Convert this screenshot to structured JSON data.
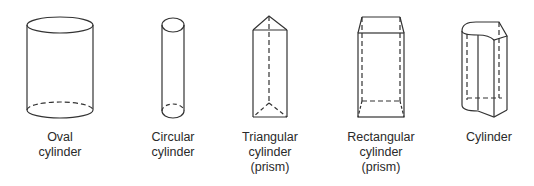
{
  "diagram": {
    "stroke_color": "#333333",
    "shapes": [
      {
        "id": "oval-cylinder",
        "label_lines": [
          "Oval",
          "cylinder"
        ],
        "center_x": 60
      },
      {
        "id": "circular-cylinder",
        "label_lines": [
          "Circular",
          "cylinder"
        ],
        "center_x": 173
      },
      {
        "id": "triangular-cylinder",
        "label_lines": [
          "Triangular",
          "cylinder",
          "(prism)"
        ],
        "center_x": 270
      },
      {
        "id": "rectangular-cylinder",
        "label_lines": [
          "Rectangular",
          "cylinder",
          "(prism)"
        ],
        "center_x": 381
      },
      {
        "id": "cylinder",
        "label_lines": [
          "Cylinder"
        ],
        "center_x": 489
      }
    ]
  }
}
